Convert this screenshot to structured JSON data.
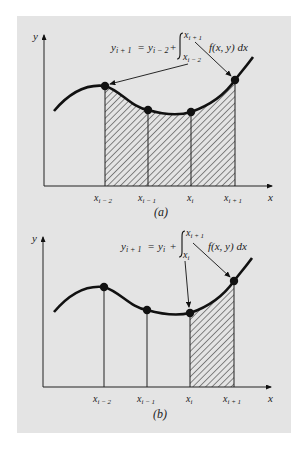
{
  "figure": {
    "background": "#e4e4e4",
    "ink": "#111111",
    "panels": [
      {
        "id": "a",
        "caption": "(a)",
        "axis_x_label": "x",
        "axis_y_label": "y",
        "formula": {
          "lhs": "y",
          "lhs_sub": "i + 1",
          "eq": "=",
          "rhs_y": "y",
          "rhs_sub": "i − 2",
          "plus": "+",
          "integral_upper": "x",
          "integral_upper_sub": "i + 1",
          "integral_lower": "x",
          "integral_lower_sub": "i − 2",
          "integrand": "f(x, y) dx"
        },
        "tick_labels": [
          {
            "main": "x",
            "sub": "i − 2"
          },
          {
            "main": "x",
            "sub": "i − 1"
          },
          {
            "main": "x",
            "sub": "i"
          },
          {
            "main": "x",
            "sub": "i + 1"
          }
        ],
        "shaded_region": "x_{i-2} to x_{i+1}"
      },
      {
        "id": "b",
        "caption": "(b)",
        "axis_x_label": "x",
        "axis_y_label": "y",
        "formula": {
          "lhs": "y",
          "lhs_sub": "i + 1",
          "eq": "=",
          "rhs_y": "y",
          "rhs_sub": "i",
          "plus": "+",
          "integral_upper": "x",
          "integral_upper_sub": "i + 1",
          "integral_lower": "x",
          "integral_lower_sub": "i",
          "integrand": "f(x, y) dx"
        },
        "tick_labels": [
          {
            "main": "x",
            "sub": "i − 2"
          },
          {
            "main": "x",
            "sub": "i − 1"
          },
          {
            "main": "x",
            "sub": "i"
          },
          {
            "main": "x",
            "sub": "i + 1"
          }
        ],
        "shaded_region": "x_i to x_{i+1}"
      }
    ]
  }
}
